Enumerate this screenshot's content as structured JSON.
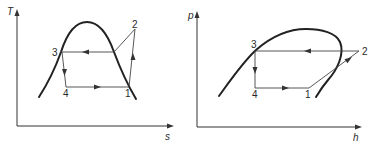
{
  "diagrams": [
    {
      "name": "T-s diagram",
      "y_axis_label": "T",
      "x_axis_label": "s",
      "points": {
        "p1": "1",
        "p2": "2",
        "p3": "3",
        "p4": "4"
      }
    },
    {
      "name": "p-h diagram",
      "y_axis_label": "p",
      "x_axis_label": "h",
      "points": {
        "p1": "1",
        "p2": "2",
        "p3": "3",
        "p4": "4"
      }
    }
  ],
  "colors": {
    "line": "#222222",
    "background": "#ffffff"
  }
}
